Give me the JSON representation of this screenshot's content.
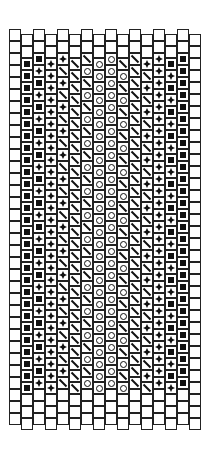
{
  "pattern": {
    "title": "",
    "columns": 16,
    "cells_per_column": 33,
    "stitch": "peyote",
    "legend": {
      "B": "blank",
      "S": "filled-square",
      "D": "diamond-star",
      "L": "diagonal-slash",
      "O": "circle"
    },
    "column_patterns": [
      {
        "top_blank": 2,
        "body": [
          "B"
        ],
        "bottom_blank": 3
      },
      {
        "top_blank": 2,
        "body": [
          "S"
        ],
        "bottom_blank": 3
      },
      {
        "top_blank": 2,
        "body": [
          "S",
          "D"
        ],
        "bottom_blank": 3
      },
      {
        "top_blank": 2,
        "body": [
          "D"
        ],
        "bottom_blank": 3
      },
      {
        "top_blank": 2,
        "body": [
          "D",
          "L"
        ],
        "bottom_blank": 3
      },
      {
        "top_blank": 2,
        "body": [
          "L"
        ],
        "bottom_blank": 3
      },
      {
        "top_blank": 2,
        "body": [
          "L",
          "O"
        ],
        "bottom_blank": 3
      },
      {
        "top_blank": 2,
        "body": [
          "O"
        ],
        "bottom_blank": 3
      },
      {
        "top_blank": 2,
        "body": [
          "O"
        ],
        "bottom_blank": 3
      },
      {
        "top_blank": 2,
        "body": [
          "L",
          "O"
        ],
        "bottom_blank": 3
      },
      {
        "top_blank": 2,
        "body": [
          "L"
        ],
        "bottom_blank": 3
      },
      {
        "top_blank": 2,
        "body": [
          "D",
          "L"
        ],
        "bottom_blank": 3
      },
      {
        "top_blank": 2,
        "body": [
          "D"
        ],
        "bottom_blank": 3
      },
      {
        "top_blank": 2,
        "body": [
          "S",
          "D"
        ],
        "bottom_blank": 3
      },
      {
        "top_blank": 2,
        "body": [
          "S"
        ],
        "bottom_blank": 3
      },
      {
        "top_blank": 2,
        "body": [
          "B"
        ],
        "bottom_blank": 3
      }
    ],
    "colors": {
      "line": "#222222",
      "fill": "#111111",
      "background": "#ffffff"
    }
  }
}
